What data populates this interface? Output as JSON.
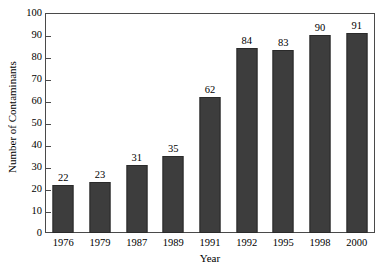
{
  "chart_data": {
    "type": "bar",
    "title": "",
    "xlabel": "Year",
    "ylabel": "Number of Contaminants",
    "categories": [
      "1976",
      "1979",
      "1987",
      "1989",
      "1991",
      "1992",
      "1995",
      "1998",
      "2000"
    ],
    "values": [
      22,
      23,
      31,
      35,
      62,
      84,
      83,
      90,
      91
    ],
    "data_labels": [
      "22",
      "23",
      "31",
      "35",
      "62",
      "84",
      "83",
      "90",
      "91"
    ],
    "ylim": [
      0,
      100
    ],
    "ytick_labels": [
      "0",
      "10",
      "20",
      "30",
      "40",
      "50",
      "60",
      "70",
      "80",
      "90",
      "100"
    ],
    "ytick_values": [
      0,
      10,
      20,
      30,
      40,
      50,
      60,
      70,
      80,
      90,
      100
    ],
    "grid": false,
    "legend": null,
    "bar_color": "#3d3d3d",
    "bar_edge_color": "#2a2a2a",
    "frame_color": "#4a4a4a",
    "background_color": "#ffffff"
  }
}
